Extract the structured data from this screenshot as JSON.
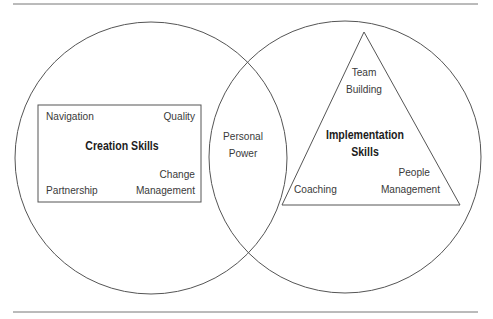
{
  "diagram": {
    "colors": {
      "stroke": "#555555",
      "rule": "#777777",
      "text": "#3a3a3a"
    },
    "left_circle": {
      "box": {
        "title": "Creation Skills",
        "items": [
          "Navigation",
          "Quality",
          "Partnership",
          "Change",
          "Management"
        ]
      }
    },
    "overlap": {
      "line1": "Personal",
      "line2": "Power"
    },
    "right_circle": {
      "triangle": {
        "title_line1": "Implementation",
        "title_line2": "Skills",
        "top_line1": "Team",
        "top_line2": "Building",
        "bottom_left": "Coaching",
        "bottom_right_line1": "People",
        "bottom_right_line2": "Management"
      }
    }
  }
}
